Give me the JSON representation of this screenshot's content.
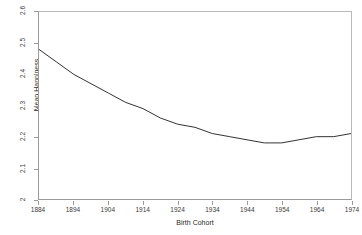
{
  "chart_data": {
    "type": "line",
    "title": "",
    "xlabel": "Birth Cohort",
    "ylabel": "Mean Happiness",
    "xlim": [
      1884,
      1974
    ],
    "ylim": [
      2.0,
      2.6
    ],
    "grid": false,
    "legend": "none",
    "xticks": [
      "1884",
      "1894",
      "1904",
      "1914",
      "1924",
      "1934",
      "1944",
      "1954",
      "1964",
      "1974"
    ],
    "yticks": [
      "2",
      "2.1",
      "2.2",
      "2.3",
      "2.4",
      "2.5",
      "2.6"
    ],
    "series": [
      {
        "name": "Mean Happiness by Birth Cohort",
        "color": "#333333",
        "x": [
          1884,
          1889,
          1894,
          1899,
          1904,
          1909,
          1914,
          1919,
          1924,
          1929,
          1934,
          1939,
          1944,
          1949,
          1954,
          1959,
          1964,
          1969,
          1974
        ],
        "values": [
          2.48,
          2.44,
          2.4,
          2.37,
          2.34,
          2.31,
          2.29,
          2.26,
          2.24,
          2.23,
          2.21,
          2.2,
          2.19,
          2.18,
          2.18,
          2.19,
          2.2,
          2.2,
          2.21
        ]
      }
    ],
    "annotations": []
  }
}
